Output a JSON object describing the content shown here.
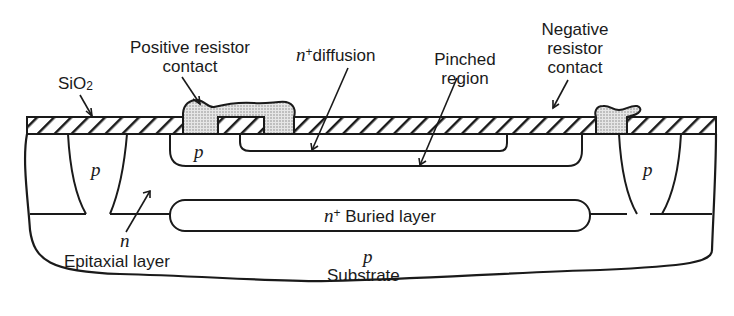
{
  "figure": {
    "type": "cross-section diagram"
  },
  "labels": {
    "sio2": {
      "main": "SiO",
      "sub": "2"
    },
    "positive_contact": {
      "line1": "Positive resistor",
      "line2": "contact"
    },
    "n_diffusion": {
      "prefix": "n",
      "sup": "+",
      "text": "diffusion"
    },
    "pinched_region": {
      "line1": "Pinched",
      "line2": "region"
    },
    "negative_contact": {
      "line1": "Negative",
      "line2": "resistor",
      "line3": "contact"
    },
    "p_left_isolation": "p",
    "p_base_diffusion": "p",
    "p_right_isolation": "p",
    "buried_layer": {
      "prefix": "n",
      "sup": "+",
      "text": " Buried layer"
    },
    "epitaxial": {
      "type": "n",
      "text": "Epitaxial layer"
    },
    "substrate": {
      "type": "p",
      "text": "Substrate"
    }
  },
  "colors": {
    "stroke": "#1a1a1a",
    "metal_fill": "#d6d6d6",
    "background": "#ffffff"
  }
}
